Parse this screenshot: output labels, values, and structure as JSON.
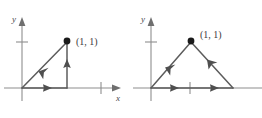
{
  "figure": {
    "title": "",
    "background_color": "#ffffff",
    "axis_color": "#8e8e8e",
    "path_color": "#5c5c5c",
    "dot_color": "#1a1a1a",
    "label_color": "#3b3b3b"
  },
  "panels": [
    {
      "id": "left",
      "name": "triangular-path-right-angle",
      "axes": {
        "y_label": "y",
        "x_label": "x",
        "y_tick_count": 1,
        "x_tick_count": 1,
        "origin_px": [
          22,
          88
        ]
      },
      "point": {
        "label": "(1, 1)",
        "x_value": 1,
        "y_value": 1,
        "pixel": [
          67,
          41
        ]
      },
      "segments": [
        {
          "name": "bottom-segment",
          "from": "origin",
          "to": "(1, 0)",
          "direction": "rightward",
          "arrow_count": 1
        },
        {
          "name": "vertical-segment",
          "from": "(1, 0)",
          "to": "(1, 1)",
          "direction": "upward",
          "arrow_count": 1
        },
        {
          "name": "hypotenuse-segment",
          "from": "(1, 1)",
          "to": "origin",
          "direction": "down-left",
          "arrow_count": 1
        }
      ]
    },
    {
      "id": "right",
      "name": "triangular-path-isosceles",
      "axes": {
        "y_label": "y",
        "x_label": "",
        "y_tick_count": 1,
        "x_tick_count": 1,
        "origin_px": [
          20,
          88
        ]
      },
      "point": {
        "label": "(1, 1)",
        "x_value": 1,
        "y_value": 1,
        "pixel": [
          60,
          41
        ]
      },
      "segments": [
        {
          "name": "bottom-segment",
          "from": "origin",
          "to": "(2, 0)",
          "direction": "rightward",
          "arrow_count": 2
        },
        {
          "name": "right-slope-segment",
          "from": "(2, 0)",
          "to": "(1, 1)",
          "direction": "up-left",
          "arrow_count": 1
        },
        {
          "name": "left-slope-segment",
          "from": "(1, 1)",
          "to": "origin",
          "direction": "down-left",
          "arrow_count": 1
        }
      ]
    }
  ]
}
